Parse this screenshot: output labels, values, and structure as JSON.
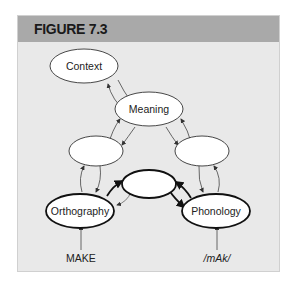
{
  "figure": {
    "title": "FIGURE 7.3",
    "nodes": {
      "context": "Context",
      "meaning": "Meaning",
      "orthography": "Orthography",
      "phonology": "Phonology"
    },
    "inputs": {
      "orthography_input": "MAKE",
      "phonology_input": "/mAk/"
    }
  }
}
